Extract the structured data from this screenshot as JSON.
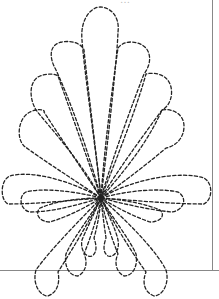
{
  "image": {
    "title": "Quilting stencil - dashed fan/feather motif",
    "caption_fragment": "…",
    "description": "Dashed-line quilting pattern: fan of elongated rounded petals radiating from a single center point, upper fan with 7 petals, lower side and bottom petals",
    "colors": {
      "background": "#ffffff",
      "stroke": "#222222",
      "frame": "#888888"
    },
    "center": {
      "x": 101,
      "y": 198
    }
  }
}
